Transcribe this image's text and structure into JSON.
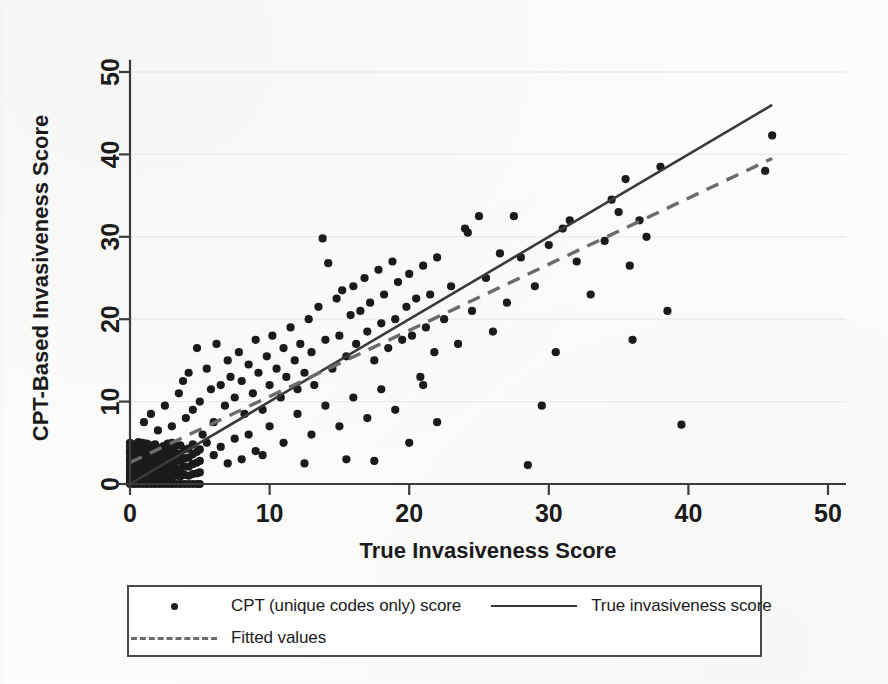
{
  "chart_data": {
    "type": "scatter",
    "title": "",
    "xlabel": "True Invasiveness Score",
    "ylabel": "CPT-Based Invasiveness Score",
    "xlim": [
      0,
      52
    ],
    "ylim": [
      0,
      52
    ],
    "xticks": [
      0,
      10,
      20,
      30,
      40,
      50
    ],
    "yticks": [
      0,
      10,
      20,
      30,
      40,
      50
    ],
    "grid": "horizontal-faint",
    "legend_position": "below-plot",
    "series": [
      {
        "name": "CPT (unique codes only) score",
        "type": "scatter",
        "marker": "filled-circle",
        "color": "#1b1b1b",
        "points": [
          [
            0,
            0
          ],
          [
            0,
            0.3
          ],
          [
            0,
            0.6
          ],
          [
            0,
            1
          ],
          [
            0,
            1.4
          ],
          [
            0,
            1.9
          ],
          [
            0,
            2.3
          ],
          [
            0,
            2.8
          ],
          [
            0,
            3.2
          ],
          [
            0,
            3.7
          ],
          [
            0,
            4.1
          ],
          [
            0,
            4.6
          ],
          [
            0,
            5
          ],
          [
            0.3,
            0
          ],
          [
            0.3,
            0.5
          ],
          [
            0.3,
            1.1
          ],
          [
            0.3,
            1.8
          ],
          [
            0.3,
            2.4
          ],
          [
            0.3,
            3
          ],
          [
            0.3,
            3.6
          ],
          [
            0.3,
            4.2
          ],
          [
            0.3,
            4.8
          ],
          [
            0.6,
            0
          ],
          [
            0.6,
            0.4
          ],
          [
            0.6,
            0.9
          ],
          [
            0.6,
            1.5
          ],
          [
            0.6,
            2.1
          ],
          [
            0.6,
            2.7
          ],
          [
            0.6,
            3.3
          ],
          [
            0.6,
            3.9
          ],
          [
            0.6,
            4.5
          ],
          [
            0.6,
            5.1
          ],
          [
            0.9,
            0
          ],
          [
            0.9,
            0.6
          ],
          [
            0.9,
            1.2
          ],
          [
            0.9,
            1.9
          ],
          [
            0.9,
            2.5
          ],
          [
            0.9,
            3.1
          ],
          [
            0.9,
            3.8
          ],
          [
            0.9,
            4.4
          ],
          [
            0.9,
            5
          ],
          [
            1.2,
            0
          ],
          [
            1.2,
            0.5
          ],
          [
            1.2,
            1.1
          ],
          [
            1.2,
            1.7
          ],
          [
            1.2,
            2.3
          ],
          [
            1.2,
            3
          ],
          [
            1.2,
            3.6
          ],
          [
            1.2,
            4.3
          ],
          [
            1.2,
            4.9
          ],
          [
            1.5,
            0
          ],
          [
            1.5,
            0.7
          ],
          [
            1.5,
            1.3
          ],
          [
            1.5,
            2
          ],
          [
            1.5,
            2.6
          ],
          [
            1.5,
            3.3
          ],
          [
            1.5,
            4
          ],
          [
            1.5,
            4.7
          ],
          [
            1.8,
            0
          ],
          [
            1.8,
            0.6
          ],
          [
            1.8,
            1.2
          ],
          [
            1.8,
            1.9
          ],
          [
            1.8,
            2.6
          ],
          [
            1.8,
            3.3
          ],
          [
            1.8,
            4
          ],
          [
            1.8,
            4.8
          ],
          [
            2.1,
            0
          ],
          [
            2.1,
            0.8
          ],
          [
            2.1,
            1.5
          ],
          [
            2.1,
            2.2
          ],
          [
            2.1,
            2.9
          ],
          [
            2.1,
            3.7
          ],
          [
            2.1,
            4.4
          ],
          [
            2.4,
            0
          ],
          [
            2.4,
            0.7
          ],
          [
            2.4,
            1.4
          ],
          [
            2.4,
            2.2
          ],
          [
            2.4,
            3
          ],
          [
            2.4,
            3.8
          ],
          [
            2.4,
            4.6
          ],
          [
            2.7,
            0
          ],
          [
            2.7,
            0.9
          ],
          [
            2.7,
            1.7
          ],
          [
            2.7,
            2.5
          ],
          [
            2.7,
            3.3
          ],
          [
            2.7,
            4.1
          ],
          [
            2.7,
            4.9
          ],
          [
            3,
            0
          ],
          [
            3,
            0.8
          ],
          [
            3,
            1.6
          ],
          [
            3,
            2.5
          ],
          [
            3,
            3.3
          ],
          [
            3,
            4.2
          ],
          [
            3,
            5
          ],
          [
            3.3,
            0
          ],
          [
            3.3,
            1
          ],
          [
            3.3,
            1.9
          ],
          [
            3.3,
            2.8
          ],
          [
            3.3,
            3.7
          ],
          [
            3.3,
            4.6
          ],
          [
            3.6,
            0
          ],
          [
            3.6,
            0.9
          ],
          [
            3.6,
            1.8
          ],
          [
            3.6,
            2.8
          ],
          [
            3.6,
            3.7
          ],
          [
            3.6,
            4.7
          ],
          [
            3.9,
            0
          ],
          [
            3.9,
            1.1
          ],
          [
            3.9,
            2.1
          ],
          [
            3.9,
            3.1
          ],
          [
            3.9,
            4.2
          ],
          [
            4.2,
            0
          ],
          [
            4.2,
            1
          ],
          [
            4.2,
            2.1
          ],
          [
            4.2,
            3.2
          ],
          [
            4.2,
            4.3
          ],
          [
            4.5,
            0
          ],
          [
            4.5,
            1.2
          ],
          [
            4.5,
            2.4
          ],
          [
            4.5,
            3.6
          ],
          [
            4.5,
            4.8
          ],
          [
            4.8,
            0
          ],
          [
            4.8,
            1.3
          ],
          [
            4.8,
            2.6
          ],
          [
            4.8,
            3.9
          ],
          [
            5,
            0
          ],
          [
            5,
            1.4
          ],
          [
            5,
            2.8
          ],
          [
            5,
            4.2
          ],
          [
            1,
            7.5
          ],
          [
            1.5,
            8.5
          ],
          [
            2,
            6.5
          ],
          [
            2.5,
            9.5
          ],
          [
            3,
            7
          ],
          [
            3.5,
            11
          ],
          [
            3.8,
            12.5
          ],
          [
            4,
            8
          ],
          [
            4.2,
            13.5
          ],
          [
            4.5,
            9
          ],
          [
            4.8,
            16.5
          ],
          [
            5,
            10
          ],
          [
            5.2,
            6
          ],
          [
            5.5,
            14
          ],
          [
            5.8,
            11.5
          ],
          [
            6,
            7.5
          ],
          [
            6.2,
            17
          ],
          [
            6.5,
            12
          ],
          [
            6.8,
            9.5
          ],
          [
            7,
            15
          ],
          [
            7.2,
            13
          ],
          [
            7.5,
            10.5
          ],
          [
            7.8,
            16
          ],
          [
            8,
            12.5
          ],
          [
            8.2,
            8.5
          ],
          [
            8.5,
            14.5
          ],
          [
            8.8,
            11
          ],
          [
            9,
            17.5
          ],
          [
            9.2,
            13.5
          ],
          [
            9.5,
            9
          ],
          [
            9.8,
            15.5
          ],
          [
            10,
            12
          ],
          [
            10.2,
            18
          ],
          [
            10.5,
            14
          ],
          [
            10.8,
            10.5
          ],
          [
            11,
            16.5
          ],
          [
            11.2,
            13
          ],
          [
            11.5,
            19
          ],
          [
            11.8,
            15
          ],
          [
            12,
            11.5
          ],
          [
            12.2,
            17
          ],
          [
            12.5,
            13.5
          ],
          [
            12.8,
            20
          ],
          [
            13,
            16
          ],
          [
            13.2,
            12
          ],
          [
            13.5,
            21.5
          ],
          [
            13.8,
            29.8
          ],
          [
            14,
            17.5
          ],
          [
            14.2,
            26.8
          ],
          [
            14.5,
            14
          ],
          [
            14.8,
            22.5
          ],
          [
            15,
            18
          ],
          [
            15.2,
            23.5
          ],
          [
            15.5,
            15.5
          ],
          [
            15.8,
            20.5
          ],
          [
            16,
            24
          ],
          [
            16.2,
            17
          ],
          [
            16.5,
            21
          ],
          [
            16.8,
            25
          ],
          [
            17,
            18.5
          ],
          [
            17.2,
            22
          ],
          [
            17.5,
            15
          ],
          [
            17.8,
            26
          ],
          [
            18,
            19.5
          ],
          [
            18.2,
            23
          ],
          [
            18.5,
            16.5
          ],
          [
            18.8,
            27
          ],
          [
            19,
            20
          ],
          [
            19.2,
            24.5
          ],
          [
            19.5,
            17.5
          ],
          [
            19.8,
            21.5
          ],
          [
            20,
            25.5
          ],
          [
            20.2,
            18
          ],
          [
            20.5,
            22.5
          ],
          [
            20.8,
            13
          ],
          [
            21,
            26.5
          ],
          [
            21.2,
            19
          ],
          [
            21.5,
            23
          ],
          [
            21.8,
            16
          ],
          [
            22,
            27.5
          ],
          [
            22.5,
            20
          ],
          [
            23,
            24
          ],
          [
            23.5,
            17
          ],
          [
            24,
            31
          ],
          [
            24.2,
            30.5
          ],
          [
            24.5,
            21
          ],
          [
            25,
            32.5
          ],
          [
            25.5,
            25
          ],
          [
            26,
            18.5
          ],
          [
            26.5,
            28
          ],
          [
            27,
            22
          ],
          [
            27.5,
            32.5
          ],
          [
            28,
            27.5
          ],
          [
            28.5,
            2.3
          ],
          [
            29,
            24
          ],
          [
            29.5,
            9.5
          ],
          [
            30,
            29
          ],
          [
            30.5,
            16
          ],
          [
            31,
            31
          ],
          [
            31.5,
            32
          ],
          [
            32,
            27
          ],
          [
            33,
            23
          ],
          [
            34,
            29.5
          ],
          [
            34.5,
            34.5
          ],
          [
            35,
            33
          ],
          [
            35.5,
            37
          ],
          [
            35.8,
            26.5
          ],
          [
            36,
            17.5
          ],
          [
            36.5,
            32
          ],
          [
            37,
            30
          ],
          [
            38,
            38.5
          ],
          [
            38.5,
            21
          ],
          [
            39.5,
            7.2
          ],
          [
            45.5,
            38
          ],
          [
            46,
            42.3
          ],
          [
            5.5,
            5
          ],
          [
            6,
            3.5
          ],
          [
            6.5,
            4.5
          ],
          [
            7,
            2.5
          ],
          [
            7.5,
            5.5
          ],
          [
            8,
            3
          ],
          [
            8.5,
            6
          ],
          [
            9,
            4
          ],
          [
            10,
            7
          ],
          [
            11,
            5
          ],
          [
            12,
            8.5
          ],
          [
            13,
            6
          ],
          [
            14,
            9.5
          ],
          [
            15,
            7
          ],
          [
            16,
            10.5
          ],
          [
            17,
            8
          ],
          [
            18,
            11.5
          ],
          [
            19,
            9
          ],
          [
            20,
            5
          ],
          [
            21,
            12
          ],
          [
            22,
            7.5
          ],
          [
            12.5,
            2.5
          ],
          [
            15.5,
            3
          ],
          [
            17.5,
            2.8
          ],
          [
            9.5,
            3.5
          ]
        ]
      },
      {
        "name": "True invasiveness score",
        "type": "line",
        "style": "solid",
        "color": "#3a3a3a",
        "endpoints": [
          [
            0,
            0
          ],
          [
            46,
            46
          ]
        ]
      },
      {
        "name": "Fitted values",
        "type": "line",
        "style": "dashed",
        "color": "#6b6b6b",
        "endpoints": [
          [
            0,
            2.6
          ],
          [
            46,
            39.5
          ]
        ]
      }
    ]
  },
  "axes": {
    "x_title": "True Invasiveness Score",
    "y_title": "CPT-Based Invasiveness Score",
    "x_ticks": [
      "0",
      "10",
      "20",
      "30",
      "40",
      "50"
    ],
    "y_ticks": [
      "0",
      "10",
      "20",
      "30",
      "40",
      "50"
    ]
  },
  "legend": {
    "entries": [
      {
        "key": "dot",
        "label": "CPT (unique codes only)  score"
      },
      {
        "key": "solid-line",
        "label": "True invasiveness score"
      },
      {
        "key": "dashed-line",
        "label": "Fitted values"
      }
    ]
  },
  "colors": {
    "marker": "#1b1b1b",
    "identity_line": "#3a3a3a",
    "fitted_line": "#6b6b6b",
    "axis": "#3c3c3c",
    "background": "#fcfcfb"
  }
}
